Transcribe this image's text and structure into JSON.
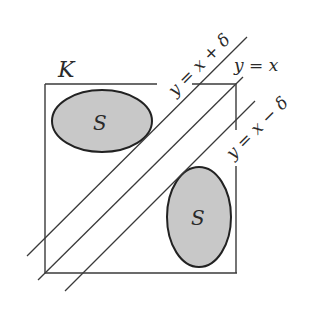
{
  "diagram": {
    "set_label": "K",
    "region_labels": [
      "S",
      "S"
    ],
    "lines": [
      {
        "id": "upper",
        "label": "y = x + δ"
      },
      {
        "id": "main",
        "label": "y = x"
      },
      {
        "id": "lower",
        "label": "y = x − δ"
      }
    ],
    "colors": {
      "stroke": "#3a3a3a",
      "region_fill": "#c8c8c8",
      "background": "#ffffff"
    }
  }
}
